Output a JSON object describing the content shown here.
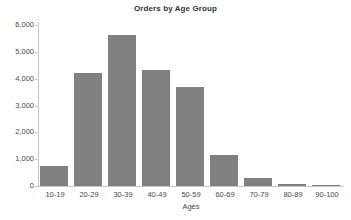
{
  "chart_data": {
    "type": "bar",
    "title": "Orders by Age Group",
    "xlabel": "Ages",
    "ylabel": "",
    "categories": [
      "10-19",
      "20-29",
      "30-39",
      "40-49",
      "50-59",
      "60-69",
      "70-79",
      "80-89",
      "90-100"
    ],
    "values": [
      750,
      4230,
      5620,
      4330,
      3680,
      1160,
      300,
      70,
      25
    ],
    "ylim": [
      0,
      6000
    ],
    "ytick_values": [
      0,
      1000,
      2000,
      3000,
      4000,
      5000,
      6000
    ],
    "ytick_labels": [
      "0",
      "1,000",
      "2,000",
      "3,000",
      "4,000",
      "5,000",
      "6,000"
    ],
    "grid": false,
    "legend": false,
    "bar_color": "#808080",
    "axis_color": "#c9c9c9",
    "text_color": "#4a4a4a",
    "background": "#ffffff"
  }
}
